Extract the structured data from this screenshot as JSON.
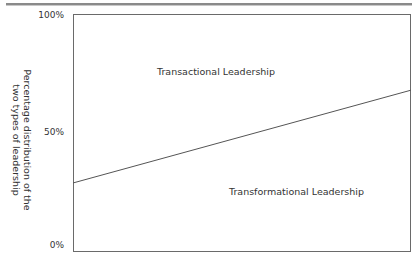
{
  "chart_data": {
    "type": "area",
    "title": "",
    "xlabel": "",
    "ylabel": "Percentage distribution of the two types of leadership",
    "ylabel_lines": [
      "Percentage distribution of the",
      "two types of leadership"
    ],
    "yticks": [
      "100%",
      "50%",
      "0%"
    ],
    "ylim": [
      0,
      100
    ],
    "grid": false,
    "boundary_line": {
      "x": [
        0,
        1
      ],
      "y": [
        29,
        68
      ]
    },
    "regions": [
      {
        "name": "Transactional Leadership",
        "position": "above line"
      },
      {
        "name": "Transformational Leadership",
        "position": "below line"
      }
    ],
    "line_color": "#555555"
  },
  "labels": {
    "y100": "100%",
    "y50": "50%",
    "y0": "0%",
    "ylabel_line1": "Percentage distribution of the",
    "ylabel_line2": "two types of leadership",
    "upper_region": "Transactional Leadership",
    "lower_region": "Transformational Leadership"
  }
}
